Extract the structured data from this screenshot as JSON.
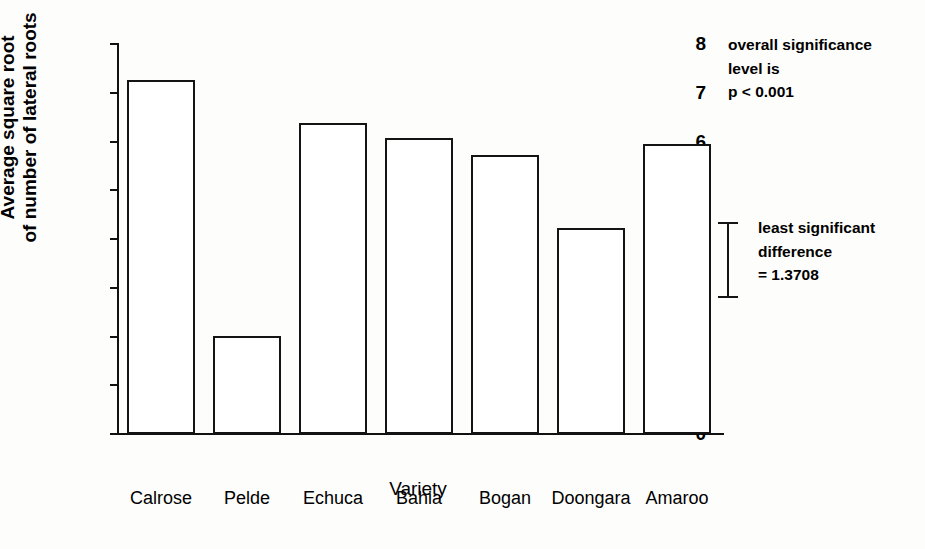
{
  "chart_data": {
    "type": "bar",
    "title": "",
    "xlabel": "Variety",
    "ylabel": "Average square root\nof number of lateral roots",
    "categories": [
      "Calrose",
      "Pelde",
      "Echuca",
      "Bahia",
      "Bogan",
      "Doongara",
      "Amaroo"
    ],
    "values": [
      7.26,
      2.02,
      6.39,
      6.07,
      5.73,
      4.23,
      5.94
    ],
    "ylim": [
      0,
      8
    ],
    "yticks": [
      0,
      1,
      2,
      3,
      4,
      5,
      6,
      7,
      8
    ],
    "ytick_labels": [
      "0",
      "1",
      "2",
      "3",
      "4",
      "5",
      "6",
      "7",
      "8"
    ],
    "grid": false,
    "legend": false,
    "bar_style": {
      "fill": "#ffffff",
      "edge": "#141414"
    },
    "annotations": [
      {
        "name": "significance-note",
        "text": "overall significance\nlevel is\np < 0.001"
      },
      {
        "name": "lsd-annotation",
        "text": "least significant\ndifference\n= 1.3708",
        "value": 1.3708
      }
    ]
  },
  "axes": {
    "x_title": "Variety",
    "y_title": "Average square root\nof number of lateral roots"
  },
  "colors": {
    "background": "#fdfdfb",
    "ink": "#111111",
    "bar_edge": "#141414",
    "bar_fill": "#ffffff"
  }
}
